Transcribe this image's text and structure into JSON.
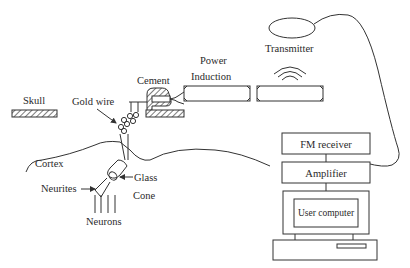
{
  "diagram": {
    "labels": {
      "skull": "Skull",
      "gold_wire": "Gold wire",
      "cement": "Cement",
      "power": "Power",
      "induction": "Induction",
      "transmitter": "Transmitter",
      "cortex": "Cortex",
      "glass": "Glass",
      "cone": "Cone",
      "neurites": "Neurites",
      "neurons": "Neurons"
    },
    "blocks": {
      "fm_receiver": "FM receiver",
      "amplifier": "Amplifier",
      "user_computer": "User computer"
    },
    "colors": {
      "line": "#333333",
      "text": "#2a2a2a",
      "background": "#ffffff"
    }
  }
}
